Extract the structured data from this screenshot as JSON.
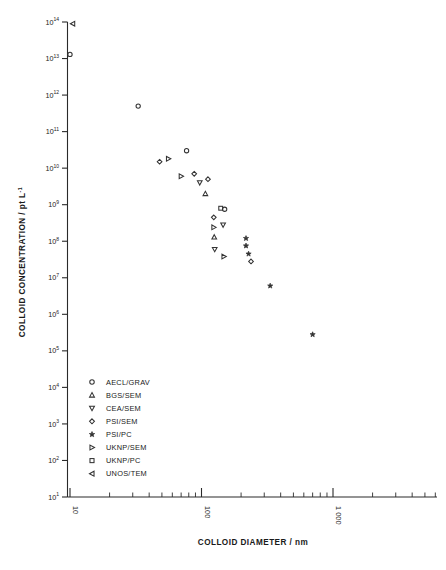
{
  "chart_data": {
    "type": "scatter",
    "title": "",
    "xlabel": "COLLOID DIAMETER / nm",
    "ylabel": "COLLOID CONCENTRATION / pt L",
    "ylabel_exponent": "-1",
    "xscale": "log",
    "yscale": "log",
    "xlim": [
      8,
      4000
    ],
    "ylim": [
      10,
      100000000000000
    ],
    "grid": false,
    "legend_position": "lower-left-inside",
    "x_tick_labels": [
      "10",
      "100",
      "1 000"
    ],
    "x_tick_values": [
      10,
      100,
      1000
    ],
    "y_tick_labels": [
      "10¹",
      "10²",
      "10³",
      "10⁴",
      "10⁵",
      "10⁶",
      "10⁷",
      "10⁸",
      "10⁹",
      "10¹⁰",
      "10¹¹",
      "10¹²",
      "10¹³",
      "10¹⁴"
    ],
    "y_tick_mantissa": [
      "10",
      "10",
      "10",
      "10",
      "10",
      "10",
      "10",
      "10",
      "10",
      "10",
      "10",
      "10",
      "10",
      "10"
    ],
    "y_tick_exponents": [
      "1",
      "2",
      "3",
      "4",
      "5",
      "6",
      "7",
      "8",
      "9",
      "10",
      "11",
      "12",
      "13",
      "14"
    ],
    "series": [
      {
        "name": "AECL/GRAV",
        "marker": "circle",
        "points": [
          {
            "x": 10.0,
            "y": 13000000000000.0
          },
          {
            "x": 33.0,
            "y": 500000000000.0
          },
          {
            "x": 77.0,
            "y": 30000000000.0
          },
          {
            "x": 150.0,
            "y": 750000000.0
          }
        ]
      },
      {
        "name": "BGS/SEM",
        "marker": "triangle-up",
        "points": [
          {
            "x": 107.0,
            "y": 2000000000.0
          },
          {
            "x": 125.0,
            "y": 130000000.0
          }
        ]
      },
      {
        "name": "CEA/SEM",
        "marker": "triangle-down",
        "points": [
          {
            "x": 97.0,
            "y": 4000000000.0
          },
          {
            "x": 126.0,
            "y": 60000000.0
          },
          {
            "x": 146.0,
            "y": 280000000.0
          }
        ]
      },
      {
        "name": "PSI/SEM",
        "marker": "diamond",
        "points": [
          {
            "x": 48.0,
            "y": 15000000000.0
          },
          {
            "x": 88.0,
            "y": 7000000000.0
          },
          {
            "x": 112.0,
            "y": 5000000000.0
          },
          {
            "x": 124.0,
            "y": 450000000.0
          },
          {
            "x": 238.0,
            "y": 28000000.0
          }
        ]
      },
      {
        "name": "PSI/PC",
        "marker": "star",
        "points": [
          {
            "x": 218.0,
            "y": 120000000.0
          },
          {
            "x": 218.0,
            "y": 75000000.0
          },
          {
            "x": 228.0,
            "y": 45000000.0
          },
          {
            "x": 333.0,
            "y": 6000000.0
          },
          {
            "x": 700.0,
            "y": 280000.0
          }
        ]
      },
      {
        "name": "UKNP/SEM",
        "marker": "triangle-right",
        "points": [
          {
            "x": 56.0,
            "y": 18000000000.0
          },
          {
            "x": 70.0,
            "y": 6000000000.0
          },
          {
            "x": 124.0,
            "y": 240000000.0
          },
          {
            "x": 148.0,
            "y": 38000000.0
          }
        ]
      },
      {
        "name": "UKNP/PC",
        "marker": "square",
        "points": [
          {
            "x": 140.0,
            "y": 800000000.0
          }
        ]
      },
      {
        "name": "UNOS/TEM",
        "marker": "triangle-left",
        "points": [
          {
            "x": 10.5,
            "y": 90000000000000.0
          }
        ]
      }
    ],
    "legend_entries": [
      {
        "label": "AECL/GRAV",
        "marker": "circle"
      },
      {
        "label": "BGS/SEM",
        "marker": "triangle-up"
      },
      {
        "label": "CEA/SEM",
        "marker": "triangle-down"
      },
      {
        "label": "PSI/SEM",
        "marker": "diamond"
      },
      {
        "label": "PSI/PC",
        "marker": "star"
      },
      {
        "label": "UKNP/SEM",
        "marker": "triangle-right"
      },
      {
        "label": "UKNP/PC",
        "marker": "square"
      },
      {
        "label": "UNOS/TEM",
        "marker": "triangle-left"
      }
    ],
    "colors": {
      "ink": "#333333",
      "axis": "#2a2a2a",
      "background": "#ffffff"
    }
  }
}
